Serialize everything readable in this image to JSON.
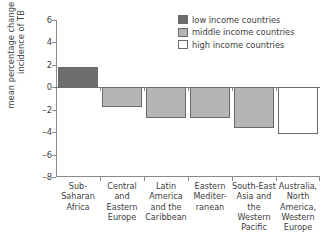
{
  "chart_data": {
    "type": "bar",
    "title": "",
    "subtitle": "",
    "xlabel": "",
    "ylabel_lines": [
      "mean percentage change in the",
      "incidence of TB"
    ],
    "ylabel": "mean percentage change in the incidence of TB",
    "ylim": [
      -8,
      6
    ],
    "yticks": [
      6,
      4,
      2,
      0,
      -2,
      -4,
      -6,
      -8
    ],
    "ytick_labels": [
      "6",
      "4",
      "2",
      "0",
      "–2",
      "–4",
      "–6",
      "–8"
    ],
    "grid": false,
    "zero_line": 0,
    "legend_position": "top-right",
    "categories": [
      "Sub-Saharan Africa",
      "Central and Eastern Europe",
      "Latin America and the Caribbean",
      "Eastern Mediterranean",
      "South-East Asia and the Western Pacific",
      "Australia, North America, Western Europe"
    ],
    "category_label_lines": [
      [
        "Sub-",
        "Saharan",
        "Africa"
      ],
      [
        "Central and",
        "Eastern",
        "Europe"
      ],
      [
        "Latin",
        "America",
        "and the",
        "Caribbean"
      ],
      [
        "Eastern",
        "Mediter-",
        "ranean"
      ],
      [
        "South-East",
        "Asia and",
        "the Western",
        "Pacific"
      ],
      [
        "Australia,",
        "North",
        "America,",
        "Western",
        "Europe"
      ]
    ],
    "values": [
      1.8,
      -1.8,
      -2.7,
      -2.7,
      -3.6,
      -4.2
    ],
    "bar_groups": [
      "low income countries",
      "middle income countries",
      "middle income countries",
      "middle income countries",
      "middle income countries",
      "high income countries"
    ],
    "series": [
      {
        "name": "mean percentage change in the incidence of TB",
        "values": [
          1.8,
          -1.8,
          -2.7,
          -2.7,
          -3.6,
          -4.2
        ]
      }
    ]
  },
  "legend": {
    "items": [
      {
        "label": "low income countries",
        "color": "#6e6e6e"
      },
      {
        "label": "middle income countries",
        "color": "#b5b5b5"
      },
      {
        "label": "high income countries",
        "color": "#ffffff"
      }
    ]
  },
  "colors": {
    "low_income": "#6e6e6e",
    "middle_income": "#b5b5b5",
    "high_income": "#ffffff",
    "bar_edge": "#6a6a6a",
    "axis": "#8a8a8a",
    "text": "#3d3d3d",
    "background": "#ffffff"
  }
}
